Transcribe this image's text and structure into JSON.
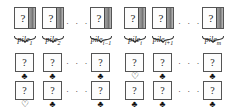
{
  "figure": {
    "kind": "card-pile-diagram",
    "question_glyph": "?",
    "ellipsis": "· · ·",
    "suits": {
      "club": "♣",
      "heart": "♡"
    }
  },
  "piles": [
    {
      "id": "pile-1",
      "label_base": "pile",
      "label_sub": "1",
      "x": 14
    },
    {
      "id": "pile-2",
      "label_base": "pile",
      "label_sub": "2",
      "x": 42
    },
    {
      "id": "pile-i-1",
      "label_base": "pile",
      "label_sub": "i−1",
      "x": 90
    },
    {
      "id": "pile-i",
      "label_base": "pile",
      "label_sub": "i",
      "x": 124
    },
    {
      "id": "pile-i+1",
      "label_base": "pile",
      "label_sub": "i+1",
      "x": 152
    },
    {
      "id": "pile-m",
      "label_base": "pile",
      "label_sub": "m",
      "x": 202
    }
  ],
  "top_ellipses": [
    {
      "x": 66,
      "y": 18
    },
    {
      "x": 178,
      "y": 18
    }
  ],
  "card_rows": [
    {
      "id": "card-row-upper",
      "y": 53,
      "cells": [
        {
          "x": 15,
          "glyph": "?",
          "suit": "club"
        },
        {
          "x": 43,
          "glyph": "?",
          "suit": "club"
        },
        {
          "x": 91,
          "glyph": "?",
          "suit": "club"
        },
        {
          "x": 125,
          "glyph": "?",
          "suit": "heart"
        },
        {
          "x": 153,
          "glyph": "?",
          "suit": "club"
        },
        {
          "x": 203,
          "glyph": "?",
          "suit": "club"
        }
      ],
      "ellipses": [
        {
          "x": 66
        },
        {
          "x": 178
        }
      ]
    },
    {
      "id": "card-row-lower",
      "y": 81,
      "cells": [
        {
          "x": 15,
          "glyph": "?",
          "suit": "heart"
        },
        {
          "x": 43,
          "glyph": "?",
          "suit": "club"
        },
        {
          "x": 91,
          "glyph": "?",
          "suit": "club"
        },
        {
          "x": 125,
          "glyph": "?",
          "suit": "club"
        },
        {
          "x": 153,
          "glyph": "?",
          "suit": "club"
        },
        {
          "x": 203,
          "glyph": "?",
          "suit": "club"
        }
      ],
      "ellipses": [
        {
          "x": 66
        },
        {
          "x": 178
        }
      ]
    }
  ]
}
